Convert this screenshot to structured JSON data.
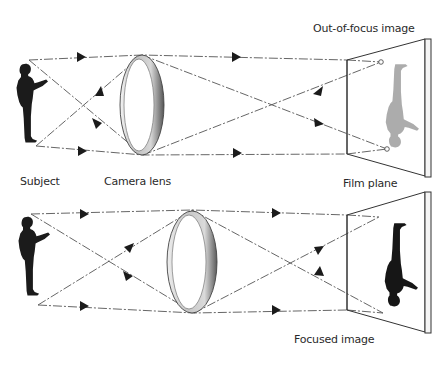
{
  "diagram": {
    "panels": [
      {
        "id": "out-of-focus",
        "caption": "Out-of-focus image",
        "labels": {
          "subject": "Subject",
          "lens": "Camera lens",
          "film": "Film plane"
        },
        "image_state": "blurred (grey, inverted)",
        "colors": {
          "image": "#a8a8a8",
          "rays": "#555555"
        }
      },
      {
        "id": "focused",
        "caption": "Focused image",
        "image_state": "sharp (black, inverted)",
        "colors": {
          "image": "#1a1a1a",
          "rays": "#555555"
        }
      }
    ],
    "elements": [
      "subject-silhouette",
      "convex-lens",
      "light-rays",
      "direction-arrows",
      "film-plane",
      "inverted-image"
    ]
  }
}
